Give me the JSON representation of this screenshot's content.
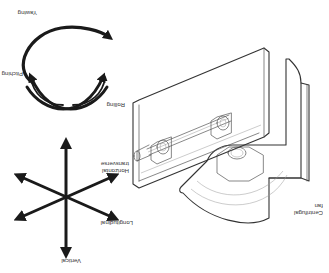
{
  "diagram": {
    "orientation": "rotated-180",
    "colors": {
      "background": "#ffffff",
      "ink": "#1a1a1a",
      "line": "#555555",
      "label": "#333333"
    },
    "fan": {
      "label_line1": "Centrifugal",
      "label_line2": "fan"
    },
    "axes": {
      "labels": {
        "vertical": "Vertical",
        "longitudinal": "Longitudinal",
        "horizontal_transverse_line1": "Horizontal",
        "horizontal_transverse_line2": "transverse"
      }
    },
    "rotations": {
      "labels": {
        "yawing": "Yawing",
        "pitching": "Pitching",
        "rolling": "Rolling"
      }
    }
  }
}
